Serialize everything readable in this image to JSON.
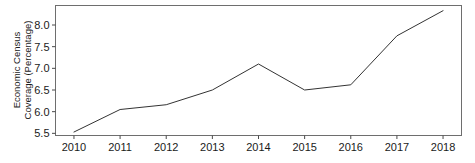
{
  "chart_data": {
    "type": "line",
    "title": "",
    "subtitle": "",
    "xlabel": "",
    "ylabel": "Economic Census Coverage (Percentage)",
    "ylabel_line1": "Economic Census",
    "ylabel_line2": "Coverage (Percentage)",
    "categories": [
      "2010",
      "2011",
      "2012",
      "2013",
      "2014",
      "2015",
      "2016",
      "2017",
      "2018"
    ],
    "x": [
      2010,
      2011,
      2012,
      2013,
      2014,
      2015,
      2016,
      2017,
      2018
    ],
    "values": [
      5.53,
      6.05,
      6.16,
      6.5,
      7.1,
      6.5,
      6.62,
      7.75,
      8.33
    ],
    "series": [
      {
        "name": "Economic Census Coverage",
        "values": [
          5.53,
          6.05,
          6.16,
          6.5,
          7.1,
          6.5,
          6.62,
          7.75,
          8.33
        ],
        "color": "#333333"
      }
    ],
    "ylim": [
      5.45,
      8.45
    ],
    "xlim": [
      2009.6,
      2018.4
    ],
    "yticks": [
      5.5,
      6.0,
      6.5,
      7.0,
      7.5,
      8.0
    ],
    "ytick_labels": [
      "5.5",
      "6.0",
      "6.5",
      "7.0",
      "7.5",
      "8.0"
    ],
    "xticks": [
      2010,
      2011,
      2012,
      2013,
      2014,
      2015,
      2016,
      2017,
      2018
    ],
    "xtick_labels": [
      "2010",
      "2011",
      "2012",
      "2013",
      "2014",
      "2015",
      "2016",
      "2017",
      "2018"
    ],
    "grid": false,
    "legend": false,
    "legend_position": "none",
    "annotations": [],
    "background_color": "#ffffff",
    "frame_color": "#6e6e6e",
    "line_color": "#333333"
  }
}
